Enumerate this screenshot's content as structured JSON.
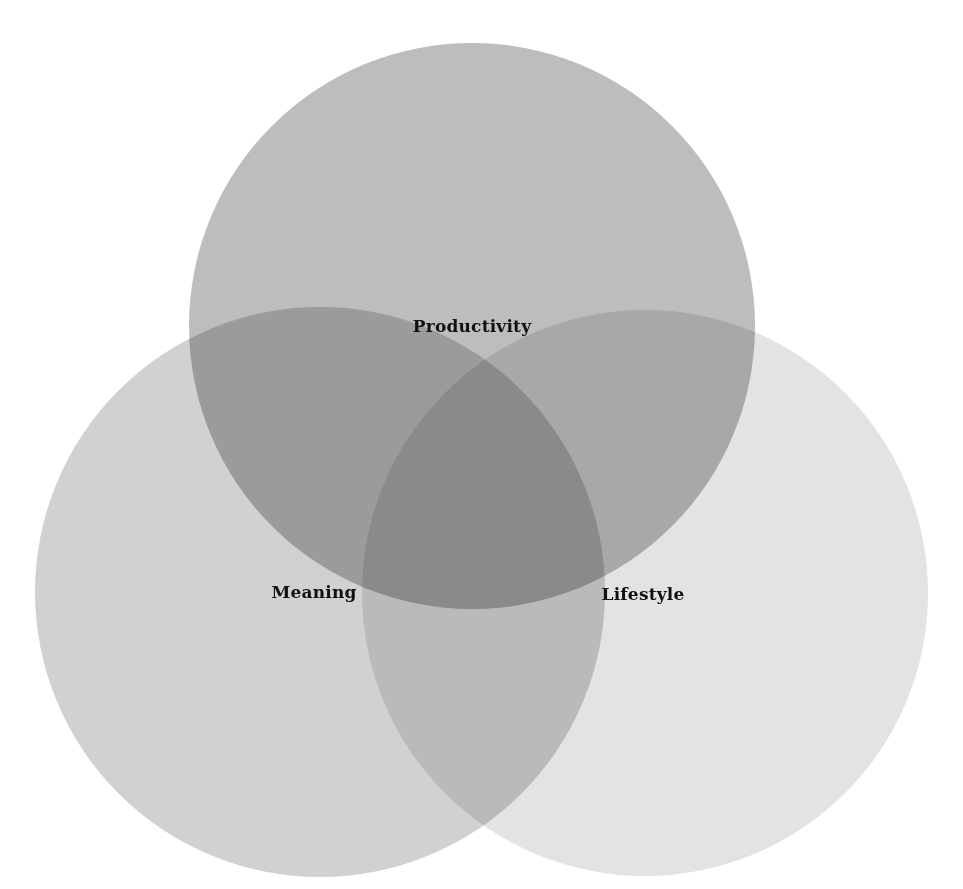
{
  "diagram": {
    "type": "venn",
    "sets": [
      {
        "id": "productivity",
        "label": "Productivity",
        "color": "#bdbdbd",
        "cx": 472,
        "cy": 326,
        "r": 283,
        "label_x": 472,
        "label_y": 326
      },
      {
        "id": "meaning",
        "label": "Meaning",
        "color": "#d1d1d1",
        "cx": 320,
        "cy": 592,
        "r": 285,
        "label_x": 314,
        "label_y": 592
      },
      {
        "id": "lifestyle",
        "label": "Lifestyle",
        "color": "#e3e3e3",
        "cx": 645,
        "cy": 593,
        "r": 283,
        "label_x": 643,
        "label_y": 594
      }
    ],
    "overlap_colors": {
      "productivity_meaning": "#a3a3a3",
      "productivity_lifestyle": "#ababab",
      "meaning_lifestyle": "#b5b5b5",
      "all_three": "#939393"
    }
  }
}
